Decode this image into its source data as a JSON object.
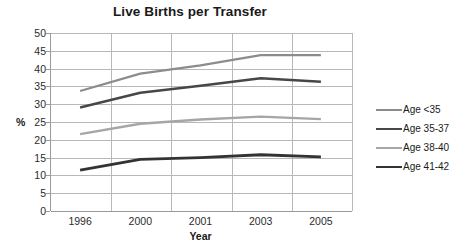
{
  "chart_data": {
    "type": "line",
    "title": "Live Births per Transfer",
    "xlabel": "Year",
    "ylabel": "%",
    "categories": [
      "1996",
      "2000",
      "2001",
      "2003",
      "2005"
    ],
    "ylim": [
      0,
      50
    ],
    "ytick_step": 5,
    "yticks": [
      "50",
      "45",
      "40",
      "35",
      "30",
      "25",
      "20",
      "15",
      "10",
      "5",
      "0"
    ],
    "grid": true,
    "legend_position": "right",
    "series": [
      {
        "name": "Age <35",
        "color": "#8c8c8c",
        "values": [
          33.7,
          38.6,
          40.9,
          43.8,
          43.8
        ]
      },
      {
        "name": "Age 35-37",
        "color": "#474747",
        "values": [
          29.1,
          33.2,
          35.2,
          37.3,
          36.3
        ]
      },
      {
        "name": "Age 38-40",
        "color": "#a6a6a6",
        "values": [
          21.6,
          24.5,
          25.7,
          26.5,
          25.8
        ]
      },
      {
        "name": "Age 41-42",
        "color": "#333333",
        "values": [
          11.5,
          14.5,
          15.0,
          15.8,
          15.2
        ]
      }
    ]
  },
  "legend": {
    "items": [
      {
        "label": "Age <35",
        "color": "#8c8c8c",
        "width": 2.2
      },
      {
        "label": "Age 35-37",
        "color": "#474747",
        "width": 2.6
      },
      {
        "label": "Age 38-40",
        "color": "#a6a6a6",
        "width": 2.4
      },
      {
        "label": "Age 41-42",
        "color": "#333333",
        "width": 2.8
      }
    ]
  }
}
